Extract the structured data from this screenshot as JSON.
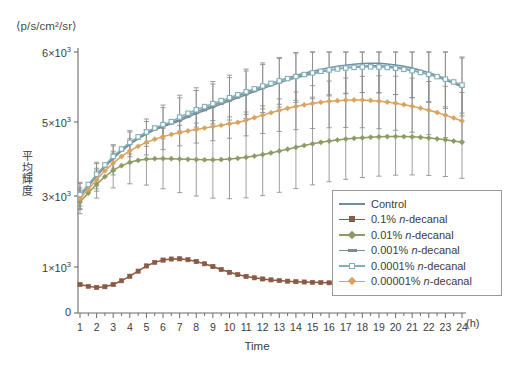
{
  "figure": {
    "unit_label": "⟨p/s/cm²/sr⟩",
    "y_axis_title": "平均輝度",
    "x_axis_title": "Time",
    "x_axis_unit": "(h)"
  },
  "chart_data": {
    "type": "line",
    "title": "",
    "xlabel": "Time",
    "ylabel": "平均輝度",
    "x_unit": "(h)",
    "y_unit": "⟨p/s/cm²/sr⟩",
    "grid": false,
    "legend_position": "bottom-right",
    "error_bars": true,
    "error_bar_color": "#8a8a8a",
    "xlim": [
      0.5,
      24.6
    ],
    "ylim": [
      0,
      6000
    ],
    "x_ticks": [
      1,
      2,
      3,
      4,
      5,
      6,
      7,
      8,
      9,
      10,
      11,
      12,
      13,
      14,
      15,
      16,
      17,
      18,
      19,
      20,
      21,
      22,
      23,
      24
    ],
    "x_tick_labels": [
      "1",
      "2",
      "3",
      "4",
      "5",
      "6",
      "7",
      "8",
      "9",
      "10",
      "11",
      "12",
      "13",
      "14",
      "15",
      "16",
      "17",
      "18",
      "19",
      "20",
      "21",
      "22",
      "23",
      "24"
    ],
    "y_ticks": [
      0,
      1000,
      3000,
      5000,
      6000
    ],
    "y_tick_labels": [
      "0",
      "1×10³",
      "3×10³",
      "5×10³",
      "6×10³"
    ],
    "x": [
      1,
      1.5,
      2,
      2.5,
      3,
      3.5,
      4,
      4.5,
      5,
      5.5,
      6,
      6.5,
      7,
      7.5,
      8,
      8.5,
      9,
      9.5,
      10,
      10.5,
      11,
      11.5,
      12,
      12.5,
      13,
      13.5,
      14,
      14.5,
      15,
      15.5,
      16,
      16.5,
      17,
      17.5,
      18,
      18.5,
      19,
      19.5,
      20,
      20.5,
      21,
      21.5,
      22,
      22.5,
      23,
      23.5,
      24
    ],
    "series": [
      {
        "name": "Control",
        "color": "#6d8ba3",
        "marker": "line",
        "values": [
          3010,
          3280,
          3560,
          3810,
          4040,
          4240,
          4420,
          4570,
          4700,
          4810,
          4900,
          4975,
          5040,
          5095,
          5145,
          5190,
          5235,
          5280,
          5325,
          5370,
          5415,
          5460,
          5505,
          5550,
          5590,
          5630,
          5665,
          5695,
          5725,
          5750,
          5775,
          5795,
          5812,
          5825,
          5835,
          5840,
          5838,
          5830,
          5815,
          5795,
          5770,
          5740,
          5705,
          5665,
          5620,
          5570,
          5515
        ],
        "errors": [
          340,
          330,
          325,
          320,
          315,
          310,
          308,
          305,
          300,
          300,
          298,
          296,
          295,
          294,
          293,
          292,
          292,
          292,
          292,
          292,
          293,
          294,
          295,
          297,
          299,
          301,
          303,
          305,
          307,
          309,
          311,
          313,
          315,
          317,
          319,
          321,
          323,
          325,
          327,
          329,
          331,
          333,
          335,
          337,
          339,
          341,
          343
        ]
      },
      {
        "name": "0.1% n-decanal",
        "label_prefix": "0.1% ",
        "label_italic": "n",
        "label_suffix": "-decanal",
        "color": "#8a5a45",
        "marker": "square",
        "values": [
          620,
          580,
          555,
          570,
          620,
          700,
          800,
          910,
          1030,
          1130,
          1195,
          1225,
          1230,
          1205,
          1155,
          1090,
          1015,
          945,
          885,
          835,
          795,
          765,
          740,
          720,
          705,
          692,
          682,
          674,
          667,
          661,
          656,
          651,
          647,
          643,
          640,
          636,
          633,
          630,
          627,
          624,
          620,
          616,
          612,
          607,
          601,
          594,
          586
        ],
        "errors": [
          30,
          28,
          26,
          28,
          30,
          33,
          36,
          40,
          44,
          47,
          49,
          50,
          50,
          49,
          47,
          44,
          41,
          38,
          35,
          33,
          31,
          29,
          27,
          26,
          25,
          24,
          23,
          22,
          22,
          21,
          21,
          20,
          20,
          20,
          19,
          19,
          19,
          18,
          18,
          18,
          18,
          17,
          17,
          17,
          17,
          16,
          16
        ]
      },
      {
        "name": "0.01% n-decanal",
        "label_prefix": "0.01% ",
        "label_italic": "n",
        "label_suffix": "-decanal",
        "color": "#8a9b63",
        "marker": "diamond",
        "values": [
          2830,
          3080,
          3320,
          3520,
          3690,
          3820,
          3910,
          3965,
          3995,
          4010,
          4012,
          4008,
          4000,
          3992,
          3985,
          3980,
          3980,
          3985,
          3998,
          4018,
          4045,
          4080,
          4120,
          4165,
          4215,
          4265,
          4315,
          4365,
          4410,
          4450,
          4485,
          4515,
          4540,
          4560,
          4575,
          4588,
          4598,
          4605,
          4608,
          4605,
          4598,
          4585,
          4568,
          4545,
          4518,
          4485,
          4450
        ],
        "errors": [
          330,
          350,
          380,
          420,
          470,
          520,
          580,
          640,
          700,
          760,
          815,
          865,
          910,
          950,
          985,
          1015,
          1040,
          1060,
          1075,
          1088,
          1098,
          1105,
          1110,
          1113,
          1115,
          1115,
          1114,
          1112,
          1109,
          1105,
          1100,
          1095,
          1089,
          1083,
          1076,
          1069,
          1062,
          1054,
          1046,
          1038,
          1029,
          1020,
          1011,
          1002,
          992,
          982,
          972
        ]
      },
      {
        "name": "0.001% n-decanal",
        "label_prefix": "0.001% ",
        "label_italic": "n",
        "label_suffix": "-decanal",
        "color": "#7a8a92",
        "marker": "tick",
        "values": [
          2990,
          3260,
          3535,
          3785,
          4015,
          4215,
          4395,
          4545,
          4675,
          4785,
          4875,
          4950,
          5015,
          5070,
          5120,
          5165,
          5210,
          5255,
          5300,
          5345,
          5390,
          5435,
          5478,
          5520,
          5560,
          5598,
          5632,
          5662,
          5690,
          5715,
          5738,
          5758,
          5775,
          5788,
          5798,
          5803,
          5802,
          5795,
          5782,
          5763,
          5740,
          5712,
          5680,
          5642,
          5600,
          5552,
          5500
        ],
        "errors": [
          350,
          345,
          342,
          340,
          338,
          336,
          334,
          333,
          332,
          331,
          330,
          330,
          330,
          330,
          330,
          331,
          332,
          333,
          334,
          336,
          338,
          340,
          342,
          344,
          347,
          350,
          353,
          356,
          359,
          362,
          365,
          368,
          371,
          374,
          377,
          380,
          383,
          386,
          389,
          392,
          395,
          398,
          401,
          404,
          407,
          410,
          413
        ]
      },
      {
        "name": "0.0001% n-decanal",
        "label_prefix": "0.0001% ",
        "label_italic": "n",
        "label_suffix": "-decanal",
        "color": "#7fb0b8",
        "marker": "square-open",
        "values": [
          3040,
          3310,
          3590,
          3840,
          4070,
          4270,
          4450,
          4600,
          4730,
          4840,
          4930,
          5005,
          5070,
          5125,
          5175,
          5220,
          5262,
          5305,
          5348,
          5390,
          5432,
          5474,
          5515,
          5552,
          5588,
          5620,
          5650,
          5678,
          5702,
          5724,
          5743,
          5758,
          5770,
          5780,
          5786,
          5788,
          5786,
          5780,
          5768,
          5752,
          5732,
          5708,
          5680,
          5648,
          5612,
          5572,
          5528
        ],
        "errors": [
          330,
          325,
          322,
          320,
          318,
          316,
          315,
          314,
          313,
          312,
          312,
          312,
          312,
          313,
          314,
          315,
          316,
          318,
          320,
          322,
          324,
          326,
          329,
          332,
          335,
          338,
          341,
          344,
          347,
          350,
          353,
          356,
          359,
          362,
          365,
          368,
          371,
          374,
          377,
          380,
          383,
          386,
          389,
          392,
          395,
          398,
          401
        ]
      },
      {
        "name": "0.00001% n-decanal",
        "label_prefix": "0.00001% ",
        "label_italic": "n",
        "label_suffix": "-decanal",
        "color": "#d8a35e",
        "marker": "diamond",
        "values": [
          2920,
          3180,
          3440,
          3680,
          3890,
          4070,
          4220,
          4345,
          4450,
          4535,
          4605,
          4665,
          4715,
          4760,
          4800,
          4838,
          4875,
          4912,
          4950,
          4988,
          5025,
          5062,
          5098,
          5132,
          5165,
          5195,
          5222,
          5245,
          5265,
          5282,
          5295,
          5305,
          5312,
          5315,
          5314,
          5308,
          5298,
          5285,
          5268,
          5248,
          5225,
          5198,
          5168,
          5135,
          5098,
          5058,
          5015
        ],
        "errors": [
          300,
          305,
          310,
          315,
          320,
          325,
          330,
          335,
          340,
          345,
          350,
          355,
          360,
          365,
          370,
          375,
          380,
          385,
          390,
          395,
          400,
          405,
          410,
          415,
          420,
          425,
          430,
          435,
          440,
          445,
          450,
          455,
          460,
          465,
          470,
          475,
          480,
          485,
          490,
          495,
          500,
          505,
          510,
          515,
          520,
          525,
          530
        ]
      }
    ]
  },
  "legend": {
    "items": [
      {
        "label": "Control",
        "prefix": "Control",
        "italic": "",
        "suffix": "",
        "color": "#6d8ba3",
        "marker": "line"
      },
      {
        "label": "0.1% n-decanal",
        "prefix": "0.1% ",
        "italic": "n",
        "suffix": "-decanal",
        "color": "#8a5a45",
        "marker": "square"
      },
      {
        "label": "0.01% n-decanal",
        "prefix": "0.01% ",
        "italic": "n",
        "suffix": "-decanal",
        "color": "#8a9b63",
        "marker": "diamond"
      },
      {
        "label": "0.001% n-decanal",
        "prefix": "0.001% ",
        "italic": "n",
        "suffix": "-decanal",
        "color": "#7a8a92",
        "marker": "tick"
      },
      {
        "label": "0.0001% n-decanal",
        "prefix": "0.0001% ",
        "italic": "n",
        "suffix": "-decanal",
        "color": "#7fb0b8",
        "marker": "square-open"
      },
      {
        "label": "0.00001% n-decanal",
        "prefix": "0.00001% ",
        "italic": "n",
        "suffix": "-decanal",
        "color": "#d8a35e",
        "marker": "diamond"
      }
    ]
  }
}
